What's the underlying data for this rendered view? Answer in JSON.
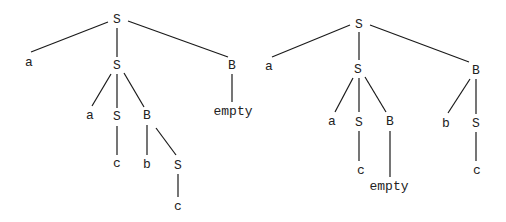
{
  "diagram": {
    "type": "parse-trees",
    "trees": [
      {
        "id": "left",
        "nodes": [
          {
            "id": "L0",
            "label": "S",
            "x": 117,
            "y": 20
          },
          {
            "id": "L1",
            "label": "a",
            "x": 29,
            "y": 63
          },
          {
            "id": "L2",
            "label": "S",
            "x": 117,
            "y": 66
          },
          {
            "id": "L3",
            "label": "B",
            "x": 232,
            "y": 66
          },
          {
            "id": "L4",
            "label": "empty",
            "x": 233,
            "y": 112
          },
          {
            "id": "L5",
            "label": "a",
            "x": 90,
            "y": 116
          },
          {
            "id": "L6",
            "label": "S",
            "x": 117,
            "y": 117
          },
          {
            "id": "L7",
            "label": "B",
            "x": 147,
            "y": 116
          },
          {
            "id": "L8",
            "label": "c",
            "x": 117,
            "y": 164
          },
          {
            "id": "L9",
            "label": "b",
            "x": 147,
            "y": 165
          },
          {
            "id": "L10",
            "label": "S",
            "x": 178,
            "y": 166
          },
          {
            "id": "L11",
            "label": "c",
            "x": 178,
            "y": 207
          }
        ],
        "edges": [
          {
            "x1": 108,
            "y1": 22,
            "x2": 31,
            "y2": 52
          },
          {
            "x1": 117,
            "y1": 28,
            "x2": 117,
            "y2": 57
          },
          {
            "x1": 128,
            "y1": 21,
            "x2": 228,
            "y2": 57
          },
          {
            "x1": 232,
            "y1": 74,
            "x2": 232,
            "y2": 102
          },
          {
            "x1": 111,
            "y1": 74,
            "x2": 92,
            "y2": 106
          },
          {
            "x1": 117,
            "y1": 74,
            "x2": 117,
            "y2": 108
          },
          {
            "x1": 124,
            "y1": 73,
            "x2": 144,
            "y2": 107
          },
          {
            "x1": 117,
            "y1": 126,
            "x2": 117,
            "y2": 155
          },
          {
            "x1": 147,
            "y1": 125,
            "x2": 147,
            "y2": 155
          },
          {
            "x1": 156,
            "y1": 128,
            "x2": 176,
            "y2": 155
          },
          {
            "x1": 178,
            "y1": 174,
            "x2": 178,
            "y2": 197
          }
        ]
      },
      {
        "id": "right",
        "nodes": [
          {
            "id": "R0",
            "label": "S",
            "x": 359,
            "y": 25
          },
          {
            "id": "R1",
            "label": "a",
            "x": 269,
            "y": 67
          },
          {
            "id": "R2",
            "label": "S",
            "x": 358,
            "y": 70
          },
          {
            "id": "R3",
            "label": "B",
            "x": 476,
            "y": 71
          },
          {
            "id": "R4",
            "label": "a",
            "x": 332,
            "y": 122
          },
          {
            "id": "R5",
            "label": "S",
            "x": 359,
            "y": 123
          },
          {
            "id": "R6",
            "label": "B",
            "x": 390,
            "y": 122
          },
          {
            "id": "R7",
            "label": "c",
            "x": 361,
            "y": 171
          },
          {
            "id": "R8",
            "label": "empty",
            "x": 389,
            "y": 187
          },
          {
            "id": "R9",
            "label": "b",
            "x": 446,
            "y": 124
          },
          {
            "id": "R10",
            "label": "S",
            "x": 476,
            "y": 124
          },
          {
            "id": "R11",
            "label": "c",
            "x": 477,
            "y": 171
          }
        ],
        "edges": [
          {
            "x1": 350,
            "y1": 25,
            "x2": 272,
            "y2": 57
          },
          {
            "x1": 359,
            "y1": 32,
            "x2": 359,
            "y2": 60
          },
          {
            "x1": 370,
            "y1": 25,
            "x2": 469,
            "y2": 62
          },
          {
            "x1": 353,
            "y1": 78,
            "x2": 335,
            "y2": 112
          },
          {
            "x1": 359,
            "y1": 78,
            "x2": 359,
            "y2": 112
          },
          {
            "x1": 365,
            "y1": 77,
            "x2": 386,
            "y2": 112
          },
          {
            "x1": 359,
            "y1": 131,
            "x2": 359,
            "y2": 161
          },
          {
            "x1": 390,
            "y1": 131,
            "x2": 390,
            "y2": 177
          },
          {
            "x1": 470,
            "y1": 79,
            "x2": 448,
            "y2": 113
          },
          {
            "x1": 476,
            "y1": 79,
            "x2": 476,
            "y2": 114
          },
          {
            "x1": 476,
            "y1": 132,
            "x2": 476,
            "y2": 161
          }
        ]
      }
    ]
  },
  "colors": {
    "background": "#ffffff",
    "line": "#1a1a1a",
    "text": "#222222"
  }
}
